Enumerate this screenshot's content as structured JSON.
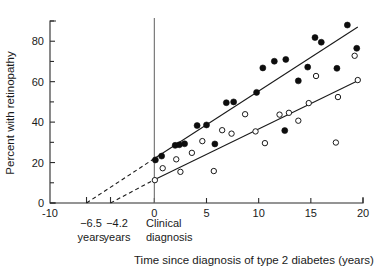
{
  "chart_data": {
    "type": "scatter",
    "title": "",
    "xlabel": "Time since diagnosis of type 2 diabetes (years)",
    "ylabel": "Percent with retinopathy",
    "xlim": [
      -10,
      20
    ],
    "ylim": [
      0,
      90
    ],
    "grid": false,
    "legend_position": "none",
    "x_ticks": [
      -10,
      0,
      5,
      10,
      15,
      20
    ],
    "x_tick_labels": [
      "-10",
      "0",
      "5",
      "10",
      "15",
      "20"
    ],
    "x_extra_ticks": [
      -6.5,
      -4.2
    ],
    "y_ticks": [
      0,
      20,
      40,
      60,
      80
    ],
    "y_tick_labels": [
      "0",
      "20",
      "40",
      "60",
      "80"
    ],
    "y_minor_ticks": [
      10,
      30,
      50,
      70,
      90
    ],
    "annotations": [
      {
        "name": "onset-marker-upper",
        "x": -6.5,
        "lines": [
          "−6.5",
          "years"
        ]
      },
      {
        "name": "onset-marker-lower",
        "x": -4.2,
        "lines": [
          "−4.2",
          "years"
        ]
      },
      {
        "name": "clinical-diagnosis-marker",
        "x": 0,
        "lines": [
          "Clinical",
          "diagnosis"
        ]
      }
    ],
    "series": [
      {
        "name": "Filled circles (higher risk cohort)",
        "marker": "filled-circle",
        "fit_line": {
          "x_start": 0,
          "y_start": 22,
          "x_end": 19.5,
          "y_end": 87,
          "extrapolation": {
            "x_start": -6.5,
            "y_start": 0,
            "x_end": 0,
            "y_end": 22,
            "style": "dashed"
          }
        },
        "points": [
          {
            "x": 0.1,
            "y": 21.3
          },
          {
            "x": 0.7,
            "y": 23.2
          },
          {
            "x": 2.0,
            "y": 28.5
          },
          {
            "x": 2.4,
            "y": 28.8
          },
          {
            "x": 2.9,
            "y": 29.3
          },
          {
            "x": 4.1,
            "y": 38.3
          },
          {
            "x": 5.0,
            "y": 38.6
          },
          {
            "x": 5.8,
            "y": 29.2
          },
          {
            "x": 6.9,
            "y": 49.6
          },
          {
            "x": 7.6,
            "y": 50.0
          },
          {
            "x": 9.8,
            "y": 54.7
          },
          {
            "x": 10.4,
            "y": 66.8
          },
          {
            "x": 11.5,
            "y": 70.1
          },
          {
            "x": 12.6,
            "y": 71.0
          },
          {
            "x": 12.5,
            "y": 35.8
          },
          {
            "x": 13.8,
            "y": 60.4
          },
          {
            "x": 14.7,
            "y": 67.2
          },
          {
            "x": 15.4,
            "y": 81.8
          },
          {
            "x": 16.0,
            "y": 79.5
          },
          {
            "x": 17.5,
            "y": 66.6
          },
          {
            "x": 18.5,
            "y": 88.0
          },
          {
            "x": 19.4,
            "y": 76.5
          }
        ]
      },
      {
        "name": "Open circles (lower risk cohort)",
        "marker": "open-circle",
        "fit_line": {
          "x_start": 0,
          "y_start": 11.5,
          "x_end": 19.5,
          "y_end": 60.5,
          "extrapolation": {
            "x_start": -4.2,
            "y_start": 0,
            "x_end": 0,
            "y_end": 11.5,
            "style": "dashed"
          }
        },
        "points": [
          {
            "x": 0.05,
            "y": 11.3
          },
          {
            "x": 0.8,
            "y": 17.2
          },
          {
            "x": 2.1,
            "y": 21.6
          },
          {
            "x": 2.5,
            "y": 15.4
          },
          {
            "x": 3.6,
            "y": 24.8
          },
          {
            "x": 4.6,
            "y": 30.6
          },
          {
            "x": 5.7,
            "y": 15.8
          },
          {
            "x": 6.5,
            "y": 36.0
          },
          {
            "x": 7.4,
            "y": 34.3
          },
          {
            "x": 8.7,
            "y": 43.9
          },
          {
            "x": 9.7,
            "y": 35.4
          },
          {
            "x": 10.6,
            "y": 29.6
          },
          {
            "x": 12.0,
            "y": 43.7
          },
          {
            "x": 12.9,
            "y": 44.6
          },
          {
            "x": 13.8,
            "y": 40.7
          },
          {
            "x": 14.8,
            "y": 49.4
          },
          {
            "x": 15.5,
            "y": 62.8
          },
          {
            "x": 17.4,
            "y": 29.9
          },
          {
            "x": 17.6,
            "y": 52.4
          },
          {
            "x": 19.2,
            "y": 72.8
          },
          {
            "x": 19.5,
            "y": 60.8
          }
        ]
      }
    ]
  },
  "labels": {
    "y_axis_title": "Percent with retinopathy",
    "x_axis_title": "Time since diagnosis of type 2 diabetes (years)",
    "y_0": "0",
    "y_20": "20",
    "y_40": "40",
    "y_60": "60",
    "y_80": "80",
    "x_neg10": "−10",
    "x_0": "0",
    "x_5": "5",
    "x_10": "10",
    "x_15": "15",
    "x_20": "20",
    "onset_upper_value": "−6.5",
    "onset_upper_unit": "years",
    "onset_lower_value": "−4.2",
    "onset_lower_unit": "years",
    "diagnosis_line1": "Clinical",
    "diagnosis_line2": "diagnosis"
  },
  "colors": {
    "axis": "#2b2b2b",
    "filled_marker": "#0d0d0d",
    "open_marker_stroke": "#1a1a1a",
    "open_marker_fill": "#ffffff",
    "fit_line": "#1a1a1a",
    "vertical_reference_line": "#6d6d6d",
    "background": "#ffffff"
  }
}
